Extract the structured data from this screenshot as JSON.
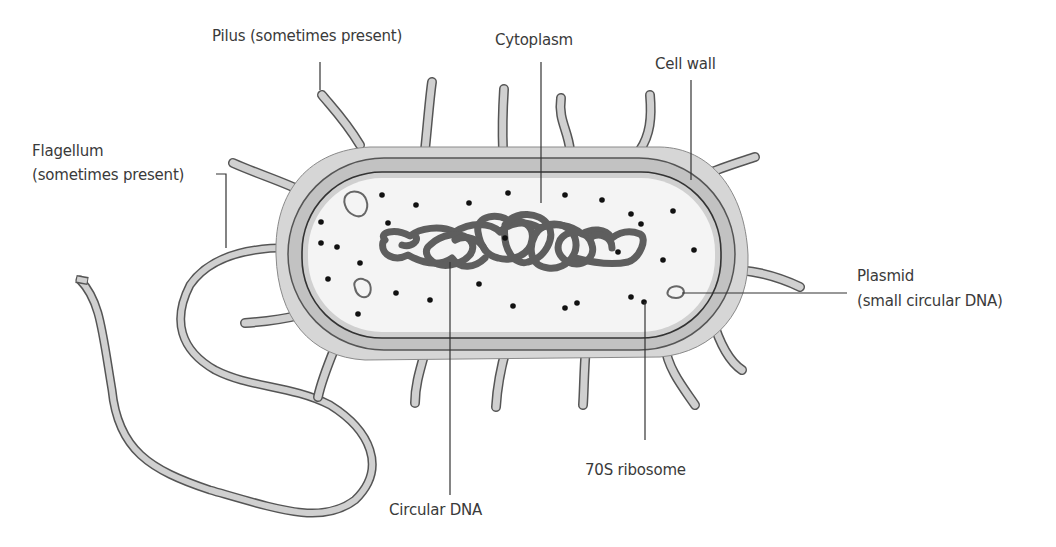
{
  "labels": {
    "pilus": "Pilus (sometimes present)",
    "cytoplasm": "Cytoplasm",
    "cell_wall": "Cell wall",
    "flagellum_line1": "Flagellum",
    "flagellum_line2": "(sometimes present)",
    "plasmid_line1": "Plasmid",
    "plasmid_line2": "(small circular DNA)",
    "ribosome": "70S ribosome",
    "circular_dna": "Circular DNA"
  },
  "colors": {
    "wall_fill": "#c8c8c8",
    "capsule_fill": "#d6d6d6",
    "membrane_band": "#bdbdbd",
    "cytoplasm_fill": "#f4f4f4",
    "outline": "#555555",
    "dna": "#5e5e5e",
    "ribosome": "#111111",
    "leader": "#333333",
    "text": "#3a3a3a"
  }
}
